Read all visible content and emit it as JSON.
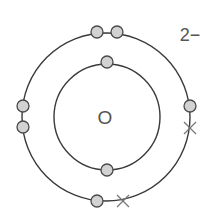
{
  "diagram": {
    "type": "electron-shell-diagram",
    "nucleus_label": "O",
    "charge_label": "2−",
    "colors": {
      "shell": "#3a3a3a",
      "electron_fill": "#d2d2d2",
      "electron_stroke": "#4a4a4a",
      "cross": "#777777",
      "text": "#555555"
    },
    "shells": [
      {
        "name": "inner",
        "cx": 107,
        "cy": 117,
        "r": 53,
        "electrons": 2
      },
      {
        "name": "outer",
        "cx": 106,
        "cy": 117,
        "r": 84,
        "electrons": 8
      }
    ],
    "electrons_dot": [
      {
        "shell": "inner",
        "x": 107,
        "y": 62
      },
      {
        "shell": "inner",
        "x": 107,
        "y": 170
      },
      {
        "shell": "outer",
        "x": 97,
        "y": 32
      },
      {
        "shell": "outer",
        "x": 117,
        "y": 32
      },
      {
        "shell": "outer",
        "x": 23,
        "y": 106
      },
      {
        "shell": "outer",
        "x": 23,
        "y": 127
      },
      {
        "shell": "outer",
        "x": 190,
        "y": 106
      },
      {
        "shell": "outer",
        "x": 97,
        "y": 201
      }
    ],
    "electrons_cross": [
      {
        "shell": "outer",
        "x": 190,
        "y": 128
      },
      {
        "shell": "outer",
        "x": 123,
        "y": 201
      }
    ]
  }
}
